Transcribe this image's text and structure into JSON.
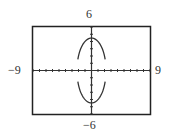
{
  "chart_data": {
    "type": "line",
    "title": "",
    "xlabel": "",
    "ylabel": "",
    "xlim": [
      -9,
      9
    ],
    "ylim": [
      -6,
      6
    ],
    "xscale": 1,
    "yscale": 1,
    "grid": false,
    "legend": null,
    "window_labels": {
      "xmin": "−9",
      "xmax": "9",
      "ymin": "−6",
      "ymax": "6"
    },
    "equation_estimate": "x^2/5 + y^2/20 = 1",
    "series": [
      {
        "name": "upper-branch",
        "shape": "concave-down arch",
        "points": [
          [
            -2.1,
            1.5
          ],
          [
            -1.5,
            3.3
          ],
          [
            -1.0,
            4.0
          ],
          [
            -0.5,
            4.36
          ],
          [
            0,
            4.47
          ],
          [
            0.5,
            4.36
          ],
          [
            1.0,
            4.0
          ],
          [
            1.5,
            3.3
          ],
          [
            2.1,
            1.5
          ]
        ]
      },
      {
        "name": "lower-branch",
        "shape": "concave-up arch",
        "points": [
          [
            -2.1,
            -1.5
          ],
          [
            -1.5,
            -3.3
          ],
          [
            -1.0,
            -4.0
          ],
          [
            -0.5,
            -4.36
          ],
          [
            0,
            -4.47
          ],
          [
            0.5,
            -4.36
          ],
          [
            1.0,
            -4.0
          ],
          [
            1.5,
            -3.3
          ],
          [
            2.1,
            -1.5
          ]
        ]
      }
    ]
  },
  "labels": {
    "ymax": "6",
    "ymin": "−6",
    "xmin": "−9",
    "xmax": "9"
  },
  "colors": {
    "frame": "#222222",
    "axes": "#333333",
    "curve": "#333333",
    "background": "#ffffff"
  }
}
